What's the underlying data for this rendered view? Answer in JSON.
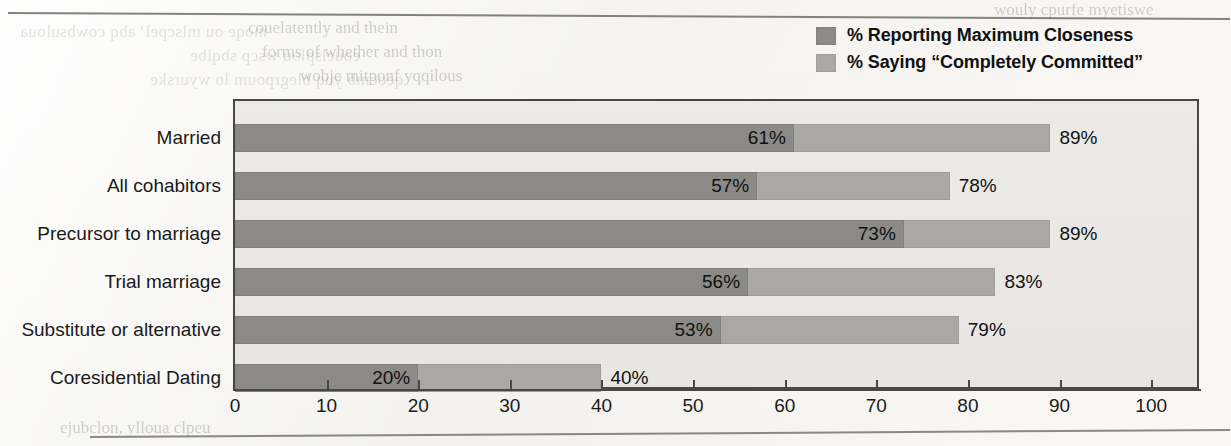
{
  "legend": {
    "items": [
      {
        "label": "% Reporting Maximum Closeness",
        "color": "#8b8a86",
        "swatch_name": "legend-swatch-closeness"
      },
      {
        "label": "% Saying “Completely Committed”",
        "color": "#a9a8a4",
        "swatch_name": "legend-swatch-committed"
      }
    ]
  },
  "chart_data": {
    "type": "bar",
    "orientation": "horizontal",
    "overlay": true,
    "title": "",
    "subtitle": "",
    "xlabel": "",
    "ylabel": "",
    "xlim": [
      0,
      105
    ],
    "x_ticks": [
      0,
      10,
      20,
      30,
      40,
      50,
      60,
      70,
      80,
      90,
      100
    ],
    "x_tick_labels": [
      "0",
      "10",
      "20",
      "30",
      "40",
      "50",
      "60",
      "70",
      "80",
      "90",
      "100"
    ],
    "grid": false,
    "legend_position": "top-right",
    "categories": [
      "Married",
      "All cohabitors",
      "Precursor to marriage",
      "Trial marriage",
      "Substitute or alternative",
      "Coresidential Dating"
    ],
    "series": [
      {
        "name": "% Reporting Maximum Closeness",
        "color": "#8b8a86",
        "values": [
          61,
          57,
          73,
          56,
          53,
          20
        ],
        "value_labels": [
          "61%",
          "57%",
          "73%",
          "56%",
          "53%",
          "20%"
        ]
      },
      {
        "name": "% Saying “Completely Committed”",
        "color": "#a9a8a4",
        "values": [
          89,
          78,
          89,
          83,
          79,
          40
        ],
        "value_labels": [
          "89%",
          "78%",
          "89%",
          "83%",
          "79%",
          "40%"
        ]
      }
    ],
    "rows": [
      {
        "category": "Married",
        "closeness": 61,
        "closeness_label": "61%",
        "committed": 89,
        "committed_label": "89%"
      },
      {
        "category": "All cohabitors",
        "closeness": 57,
        "closeness_label": "57%",
        "committed": 78,
        "committed_label": "78%"
      },
      {
        "category": "Precursor to marriage",
        "closeness": 73,
        "closeness_label": "73%",
        "committed": 89,
        "committed_label": "89%"
      },
      {
        "category": "Trial marriage",
        "closeness": 56,
        "closeness_label": "56%",
        "committed": 83,
        "committed_label": "83%"
      },
      {
        "category": "Substitute or alternative",
        "closeness": 53,
        "closeness_label": "53%",
        "committed": 79,
        "committed_label": "79%"
      },
      {
        "category": "Coresidential Dating",
        "closeness": 20,
        "closeness_label": "20%",
        "committed": 40,
        "committed_label": "40%"
      }
    ]
  },
  "style": {
    "plot_background": "#e9e8e5",
    "plot_border": "#4a4845",
    "page_background": "#f4f3f0",
    "text_color": "#1a1a1a"
  }
}
